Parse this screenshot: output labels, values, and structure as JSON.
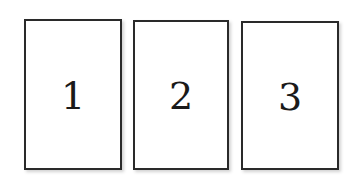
{
  "cards": [
    {
      "label": "1"
    },
    {
      "label": "2"
    },
    {
      "label": "3"
    }
  ],
  "colors": {
    "border": "#2a2a2a",
    "background": "#ffffff",
    "text": "#1a1a1a"
  }
}
